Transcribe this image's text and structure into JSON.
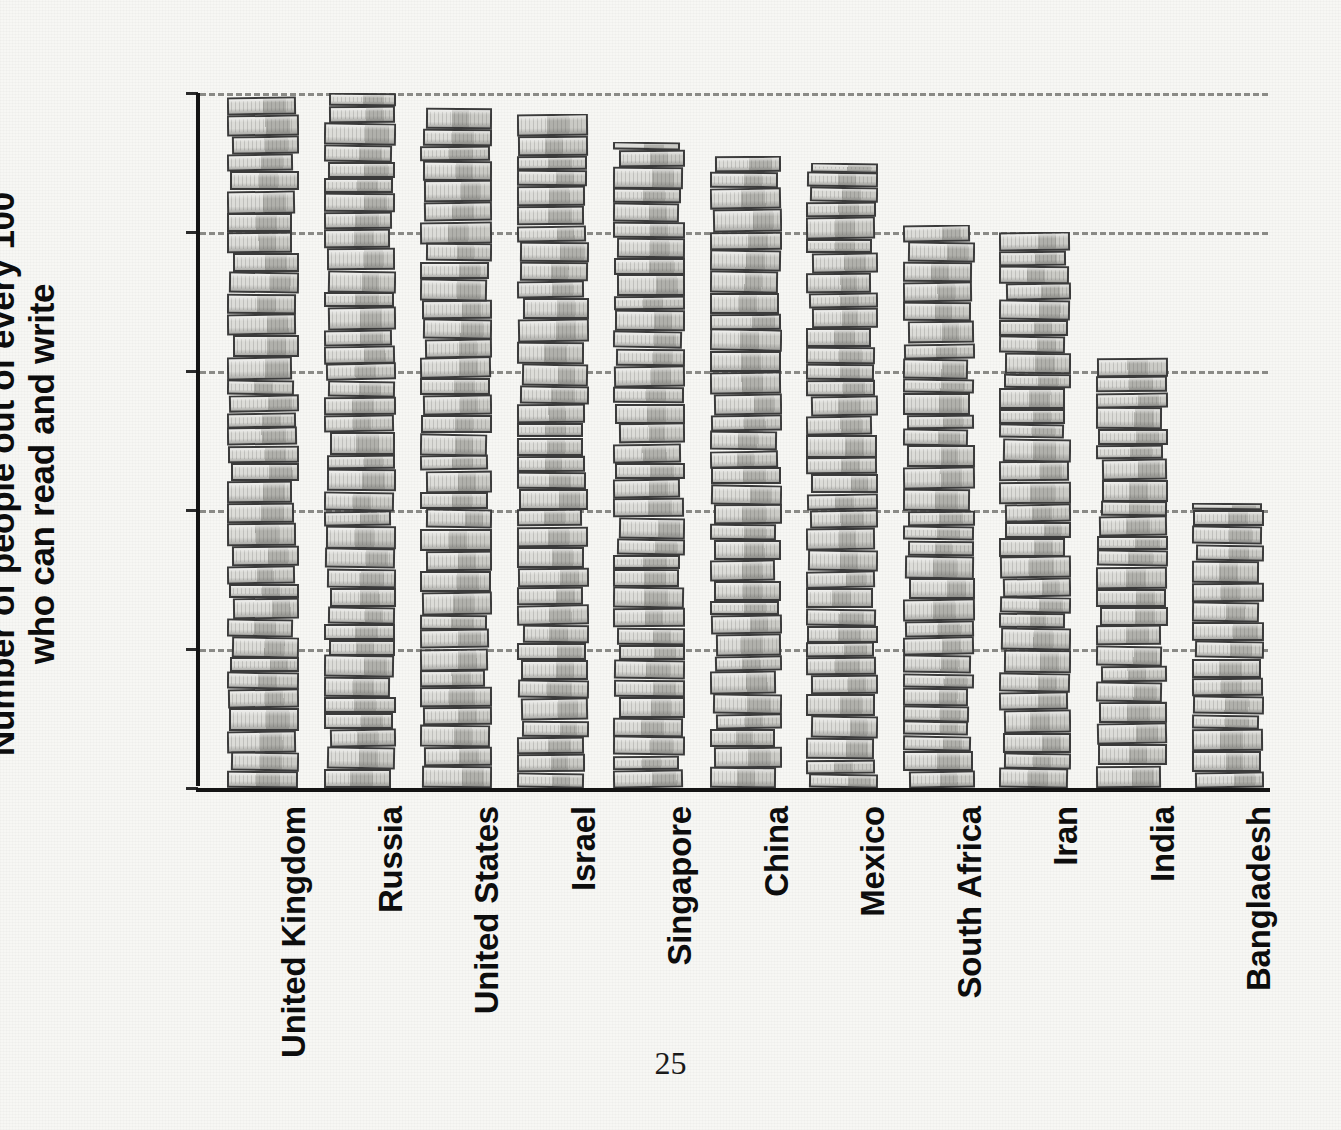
{
  "page": {
    "number": "25",
    "background_color": "#f7f7f4"
  },
  "chart_data": {
    "type": "bar",
    "title": "",
    "subtitle": "",
    "xlabel": "",
    "ylabel": "Number of people out of every 100 who can read and write",
    "ylabel_line1": "Number of people out of every 100",
    "ylabel_line2": "who can read and write",
    "categories": [
      "United Kingdom",
      "Russia",
      "United States",
      "Israel",
      "Singapore",
      "China",
      "Mexico",
      "South Africa",
      "Iran",
      "India",
      "Bangladesh"
    ],
    "values": [
      100,
      100,
      98,
      97,
      93,
      91,
      90,
      81,
      80,
      62,
      41
    ],
    "ylim": [
      0,
      100
    ],
    "yticks": [
      0,
      20,
      40,
      60,
      80,
      100
    ],
    "ytick_labels": [
      "0",
      "20",
      "40",
      "60",
      "80",
      "100"
    ],
    "grid": "horizontal-dashed",
    "legend": "none",
    "marker_style": "stacked-books-pictogram",
    "colors": {
      "axis": "#141414",
      "gridline": "#8a8a86",
      "book_light": "#d9d9d5",
      "book_mid": "#c8c8c3",
      "book_dark": "#b2b2ad",
      "book_outline": "#3b3b3b",
      "text": "#0d0d0d"
    }
  }
}
